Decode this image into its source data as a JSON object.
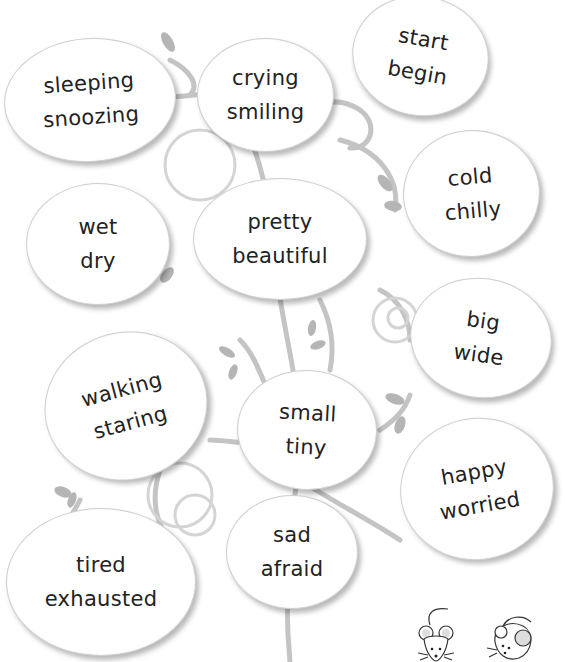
{
  "worksheet": {
    "bubbles": [
      {
        "id": "sleeping-snoozing",
        "words": [
          "sleeping",
          "snoozing"
        ],
        "x": 4,
        "y": 38,
        "w": 170,
        "h": 122,
        "rot": -4
      },
      {
        "id": "crying-smiling",
        "words": [
          "crying",
          "smiling"
        ],
        "x": 197,
        "y": 38,
        "w": 135,
        "h": 112,
        "rot": 0
      },
      {
        "id": "start-begin",
        "words": [
          "start",
          "begin"
        ],
        "x": 352,
        "y": 0,
        "w": 135,
        "h": 115,
        "rot": 12
      },
      {
        "id": "cold-chilly",
        "words": [
          "cold",
          "chilly"
        ],
        "x": 402,
        "y": 130,
        "w": 135,
        "h": 125,
        "rot": -5
      },
      {
        "id": "wet-dry",
        "words": [
          "wet",
          "dry"
        ],
        "x": 26,
        "y": 183,
        "w": 142,
        "h": 120,
        "rot": 0
      },
      {
        "id": "pretty-beautiful",
        "words": [
          "pretty",
          "beautiful"
        ],
        "x": 193,
        "y": 178,
        "w": 172,
        "h": 120,
        "rot": 0
      },
      {
        "id": "big-wide",
        "words": [
          "big",
          "wide"
        ],
        "x": 410,
        "y": 278,
        "w": 140,
        "h": 118,
        "rot": 8
      },
      {
        "id": "walking-staring",
        "words": [
          "walking",
          "staring"
        ],
        "x": 44,
        "y": 332,
        "w": 162,
        "h": 146,
        "rot": -15
      },
      {
        "id": "small-tiny",
        "words": [
          "small",
          "tiny"
        ],
        "x": 237,
        "y": 370,
        "w": 138,
        "h": 118,
        "rot": 3
      },
      {
        "id": "happy-worried",
        "words": [
          "happy",
          "worried"
        ],
        "x": 400,
        "y": 418,
        "w": 152,
        "h": 140,
        "rot": -10
      },
      {
        "id": "sad-afraid",
        "words": [
          "sad",
          "afraid"
        ],
        "x": 226,
        "y": 495,
        "w": 130,
        "h": 112,
        "rot": 0
      },
      {
        "id": "tired-exhausted",
        "words": [
          "tired",
          "exhausted"
        ],
        "x": 6,
        "y": 508,
        "w": 188,
        "h": 146,
        "rot": 0
      }
    ],
    "decorations": {
      "vine_color": "#c4c4c4",
      "leaf_color": "#b5b5b5",
      "mice": [
        "mouse-front-icon",
        "mouse-side-icon"
      ]
    }
  }
}
